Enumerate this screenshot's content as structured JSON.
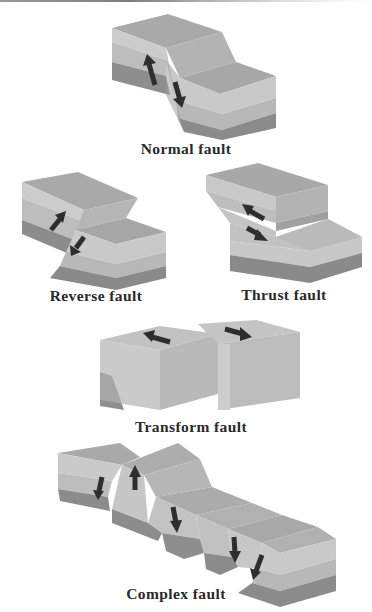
{
  "figure": {
    "colors": {
      "top_surface": "#a9a9a9",
      "layer_light": "#c9c9c9",
      "layer_mid": "#b7b7b7",
      "layer_dark": "#8c8c8c",
      "arrow": "#2e2e2e",
      "label_text": "#2a2a2a"
    },
    "panels": [
      {
        "id": "normal",
        "label": "Normal fault",
        "arrows": [
          "up",
          "down"
        ],
        "arrow_icon": "vertical-slip-arrows"
      },
      {
        "id": "reverse",
        "label": "Reverse fault",
        "arrows": [
          "up",
          "down"
        ],
        "arrow_icon": "vertical-slip-arrows"
      },
      {
        "id": "thrust",
        "label": "Thrust fault",
        "arrows": [
          "up-left",
          "down-right"
        ],
        "arrow_icon": "low-angle-slip-arrows"
      },
      {
        "id": "transform",
        "label": "Transform fault",
        "arrows": [
          "left",
          "right"
        ],
        "arrow_icon": "horizontal-slip-arrows"
      },
      {
        "id": "complex",
        "label": "Complex fault",
        "arrows": [
          "down",
          "up",
          "down",
          "down",
          "down"
        ],
        "arrow_icon": "multiple-slip-arrows"
      }
    ]
  }
}
